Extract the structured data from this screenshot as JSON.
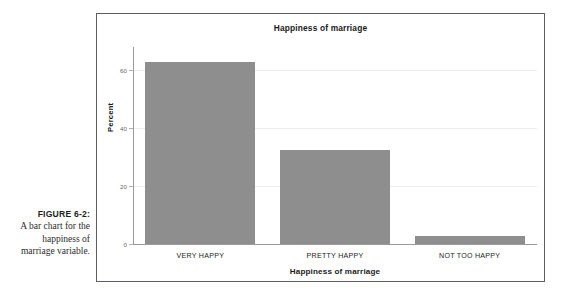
{
  "figure": {
    "number_label": "FIGURE 6-2:",
    "caption_text": "A bar chart for the happiness of marriage variable."
  },
  "colors": {
    "bar_fill": "#8e8e8e",
    "frame_border": "#5d5d63",
    "gridline": "#ededed",
    "axis_spine": "#9a9a9a",
    "tick_label": "#6a6a6a",
    "text": "#1b1b1b"
  },
  "chart_data": {
    "type": "bar",
    "title": "Happiness of marriage",
    "xlabel": "Happiness of marriage",
    "ylabel": "Percent",
    "categories": [
      "VERY HAPPY",
      "PRETTY HAPPY",
      "NOT TOO HAPPY"
    ],
    "values": [
      62.7,
      32.4,
      2.7
    ],
    "ylim": [
      0,
      68
    ],
    "yticks": [
      0,
      20,
      40,
      60
    ],
    "ytick_labels": [
      "0",
      "20",
      "40",
      "60"
    ],
    "grid": true,
    "gridlines_at": [
      20,
      40,
      60
    ],
    "legend": null,
    "legend_position": "none"
  }
}
